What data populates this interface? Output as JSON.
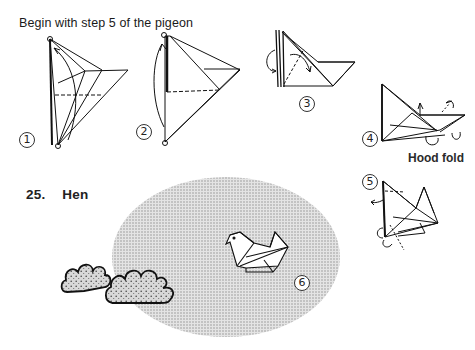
{
  "page": {
    "intro_text": "Begin with step 5 of the pigeon",
    "section_title": {
      "number": "25.",
      "name": "Hen"
    },
    "annotation": "Hood fold"
  },
  "steps": [
    {
      "label": "1",
      "description": "diagram-step-1"
    },
    {
      "label": "2",
      "description": "diagram-step-2"
    },
    {
      "label": "3",
      "description": "diagram-step-3"
    },
    {
      "label": "4",
      "description": "diagram-step-4"
    },
    {
      "label": "5",
      "description": "diagram-step-5"
    },
    {
      "label": "6",
      "description": "finished-hen"
    }
  ],
  "colors": {
    "ink": "#1a1a1a",
    "stipple_bg": "#c8c8c8",
    "bush_fill": "#bdbdbd"
  }
}
